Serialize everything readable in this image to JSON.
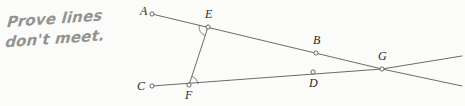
{
  "annotation": {
    "text": "Prove lines\ndon't meet.",
    "color": "#8b8b88"
  },
  "figure": {
    "stroke_color": "#5a5a5a",
    "node_fill": "#fbfbf9",
    "label_color": "#2a2a2a",
    "background": "#fbfbf9",
    "points": [
      {
        "id": "A",
        "label": "A",
        "x": 152,
        "y": 14,
        "label_x": 140,
        "label_y": 4
      },
      {
        "id": "E",
        "label": "E",
        "x": 208,
        "y": 27,
        "label_x": 205,
        "label_y": 7
      },
      {
        "id": "B",
        "label": "B",
        "x": 316,
        "y": 53,
        "label_x": 313,
        "label_y": 33
      },
      {
        "id": "G",
        "label": "G",
        "x": 382,
        "y": 69,
        "label_x": 378,
        "label_y": 49
      },
      {
        "id": "C",
        "label": "C",
        "x": 152,
        "y": 86,
        "label_x": 137,
        "label_y": 79
      },
      {
        "id": "F",
        "label": "F",
        "x": 189,
        "y": 85,
        "label_x": 185,
        "label_y": 88
      },
      {
        "id": "D",
        "label": "D",
        "x": 313,
        "y": 72,
        "label_x": 309,
        "label_y": 76
      }
    ],
    "lines": [
      {
        "id": "line-AG",
        "from": "A",
        "to": "G",
        "through": [
          "E",
          "B"
        ],
        "extend_to_x": 462,
        "extend_to_y": 86
      },
      {
        "id": "line-CG",
        "from": "C",
        "to": "G",
        "through": [
          "F",
          "D"
        ],
        "extend_to_x": 462,
        "extend_to_y": 56
      },
      {
        "id": "segment-EF",
        "from": "E",
        "to": "F"
      }
    ],
    "angle_marks": [
      {
        "id": "angle-at-E",
        "vertex": "E",
        "between": [
          "A",
          "F"
        ]
      },
      {
        "id": "angle-at-F",
        "vertex": "F",
        "between": [
          "E",
          "D"
        ]
      }
    ]
  }
}
